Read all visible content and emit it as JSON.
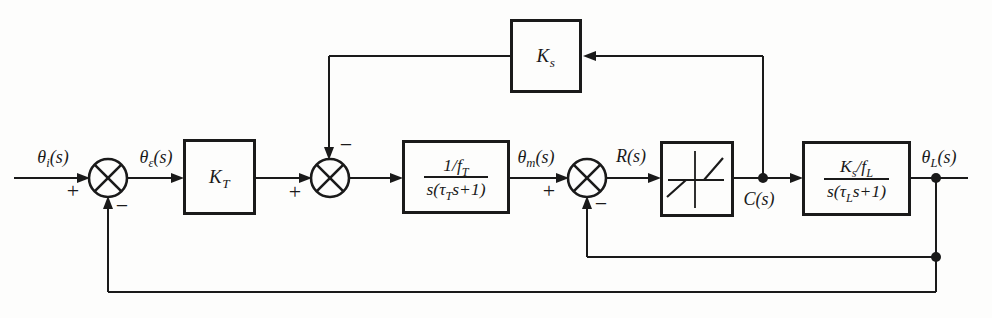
{
  "diagram": {
    "colors": {
      "ink": "#1a1a1a",
      "paper": "#fdfdfc"
    },
    "signs": {
      "plus": "+",
      "minus": "−"
    },
    "labels": {
      "theta_i": [
        {
          "t": "θ"
        },
        {
          "s": "i"
        },
        {
          "t": "(s)"
        }
      ],
      "theta_e": [
        {
          "t": "θ"
        },
        {
          "s": "ε"
        },
        {
          "t": "(s)"
        }
      ],
      "theta_m": [
        {
          "t": "θ"
        },
        {
          "s": "m"
        },
        {
          "t": "(s)"
        }
      ],
      "r_s": [
        {
          "t": "R(s)"
        }
      ],
      "c_s": [
        {
          "t": "C(s)"
        }
      ],
      "theta_l": [
        {
          "t": "θ"
        },
        {
          "s": "L"
        },
        {
          "t": "(s)"
        }
      ]
    },
    "blocks": {
      "amplifier": {
        "label": [
          {
            "t": "K"
          },
          {
            "s": "T"
          }
        ]
      },
      "motor": {
        "num": [
          {
            "t": "1/f"
          },
          {
            "s": "T"
          }
        ],
        "den": [
          {
            "t": "s(τ"
          },
          {
            "s": "T"
          },
          {
            "t": "s+1)"
          }
        ]
      },
      "nonlinearity": {
        "kind": "dead-zone"
      },
      "load": {
        "num": [
          {
            "t": "K"
          },
          {
            "s": "s"
          },
          {
            "t": "/f"
          },
          {
            "s": "L"
          }
        ],
        "den": [
          {
            "t": "s(τ"
          },
          {
            "s": "L"
          },
          {
            "t": "s+1)"
          }
        ]
      },
      "feedback": {
        "label": [
          {
            "t": "K"
          },
          {
            "s": "s"
          }
        ]
      }
    }
  }
}
